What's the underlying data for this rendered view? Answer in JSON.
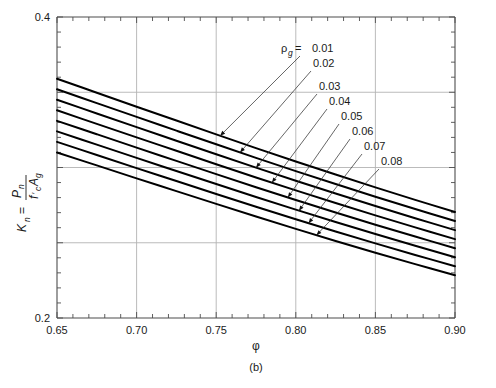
{
  "chart_data": {
    "type": "line",
    "title": "",
    "subtitle": "",
    "xlabel": "φ",
    "ylabel": "K_n = P_n / (f'_c A_g)",
    "ylabel_parts": {
      "lead_symbol": "K",
      "lead_sub": "n",
      "equals": "=",
      "numerator": "P",
      "numerator_sub": "n",
      "denominator_1": "f",
      "denominator_prime": "′",
      "denominator_1_sub": "c",
      "denominator_2": "A",
      "denominator_2_sub": "g"
    },
    "xlim": [
      0.65,
      0.9
    ],
    "ylim": [
      0.2,
      0.4
    ],
    "x_major_ticks": [
      0.65,
      0.7,
      0.75,
      0.8,
      0.85,
      0.9
    ],
    "x_tick_labels": [
      "0.65",
      "0.70",
      "0.75",
      "0.80",
      "0.85",
      "0.90"
    ],
    "x_minor_step": 0.01,
    "y_major_ticks": [
      0.2,
      0.25,
      0.3,
      0.35,
      0.4
    ],
    "y_tick_labels": [
      "0.2",
      "",
      "",
      "",
      "0.4"
    ],
    "y_minor_step": 0.01,
    "grid": true,
    "grid_color": "#b0b0b0",
    "legend_position": "inline-annotations",
    "series_param_symbol": "ρ",
    "series_param_sub": "g",
    "series_param_equals": "=",
    "series": [
      {
        "name": "0.01",
        "label": "0.01",
        "x": [
          0.65,
          0.675,
          0.7,
          0.725,
          0.75,
          0.775,
          0.8,
          0.825,
          0.85,
          0.875,
          0.9
        ],
        "values": [
          0.359,
          0.3497,
          0.3404,
          0.3312,
          0.322,
          0.3129,
          0.304,
          0.2953,
          0.2868,
          0.2785,
          0.2704
        ]
      },
      {
        "name": "0.02",
        "label": "0.02",
        "x": [
          0.65,
          0.675,
          0.7,
          0.725,
          0.75,
          0.775,
          0.8,
          0.825,
          0.85,
          0.875,
          0.9
        ],
        "values": [
          0.352,
          0.3428,
          0.3336,
          0.3245,
          0.3154,
          0.3064,
          0.2976,
          0.289,
          0.2806,
          0.2724,
          0.2644
        ]
      },
      {
        "name": "0.03",
        "label": "0.03",
        "x": [
          0.65,
          0.675,
          0.7,
          0.725,
          0.75,
          0.775,
          0.8,
          0.825,
          0.85,
          0.875,
          0.9
        ],
        "values": [
          0.345,
          0.3359,
          0.3268,
          0.3178,
          0.3088,
          0.2999,
          0.2912,
          0.2827,
          0.2744,
          0.2663,
          0.2584
        ]
      },
      {
        "name": "0.04",
        "label": "0.04",
        "x": [
          0.65,
          0.675,
          0.7,
          0.725,
          0.75,
          0.775,
          0.8,
          0.825,
          0.85,
          0.875,
          0.9
        ],
        "values": [
          0.338,
          0.329,
          0.32,
          0.3111,
          0.3022,
          0.2934,
          0.2848,
          0.2764,
          0.2682,
          0.2602,
          0.2524
        ]
      },
      {
        "name": "0.05",
        "label": "0.05",
        "x": [
          0.65,
          0.675,
          0.7,
          0.725,
          0.75,
          0.775,
          0.8,
          0.825,
          0.85,
          0.875,
          0.9
        ],
        "values": [
          0.331,
          0.3221,
          0.3132,
          0.3044,
          0.2956,
          0.2869,
          0.2784,
          0.2701,
          0.262,
          0.2541,
          0.2464
        ]
      },
      {
        "name": "0.06",
        "label": "0.06",
        "x": [
          0.65,
          0.675,
          0.7,
          0.725,
          0.75,
          0.775,
          0.8,
          0.825,
          0.85,
          0.875,
          0.9
        ],
        "values": [
          0.324,
          0.3152,
          0.3064,
          0.2977,
          0.289,
          0.2804,
          0.272,
          0.2638,
          0.2558,
          0.248,
          0.2404
        ]
      },
      {
        "name": "0.07",
        "label": "0.07",
        "x": [
          0.65,
          0.675,
          0.7,
          0.725,
          0.75,
          0.775,
          0.8,
          0.825,
          0.85,
          0.875,
          0.9
        ],
        "values": [
          0.317,
          0.3083,
          0.2996,
          0.291,
          0.2824,
          0.2739,
          0.2656,
          0.2575,
          0.2496,
          0.2419,
          0.2344
        ]
      },
      {
        "name": "0.08",
        "label": "0.08",
        "x": [
          0.65,
          0.675,
          0.7,
          0.725,
          0.75,
          0.775,
          0.8,
          0.825,
          0.85,
          0.875,
          0.9
        ],
        "values": [
          0.31,
          0.3014,
          0.2928,
          0.2843,
          0.2758,
          0.2674,
          0.2592,
          0.2512,
          0.2434,
          0.2358,
          0.2284
        ]
      }
    ],
    "annotations": [
      {
        "label": "0.01",
        "text_x": 312,
        "text_y": 52,
        "leader_from_x": 300,
        "leader_from_y": 56,
        "target_x": 0.7525,
        "target_y": 0.321
      },
      {
        "label": "0.02",
        "text_x": 313,
        "text_y": 67,
        "leader_from_x": 311,
        "leader_from_y": 71,
        "target_x": 0.765,
        "target_y": 0.311
      },
      {
        "label": "0.03",
        "text_x": 319,
        "text_y": 90,
        "leader_from_x": 317,
        "leader_from_y": 94,
        "target_x": 0.775,
        "target_y": 0.3
      },
      {
        "label": "0.04",
        "text_x": 329,
        "text_y": 105,
        "leader_from_x": 327,
        "leader_from_y": 109,
        "target_x": 0.785,
        "target_y": 0.29
      },
      {
        "label": "0.05",
        "text_x": 341,
        "text_y": 120,
        "leader_from_x": 339,
        "leader_from_y": 124,
        "target_x": 0.795,
        "target_y": 0.28
      },
      {
        "label": "0.06",
        "text_x": 352,
        "text_y": 135,
        "leader_from_x": 350,
        "leader_from_y": 139,
        "target_x": 0.802,
        "target_y": 0.27
      },
      {
        "label": "0.07",
        "text_x": 364,
        "text_y": 150,
        "leader_from_x": 362,
        "leader_from_y": 154,
        "target_x": 0.808,
        "target_y": 0.2605
      },
      {
        "label": "0.08",
        "text_x": 381,
        "text_y": 165,
        "leader_from_x": 379,
        "leader_from_y": 169,
        "target_x": 0.813,
        "target_y": 0.251
      }
    ]
  },
  "figure": {
    "panel_label": "(b)",
    "caption": ""
  },
  "colors": {
    "curve": "#000000",
    "grid": "#b3b3b3",
    "axis": "#4d4d4d",
    "text": "#1a1a1a",
    "background": "#ffffff"
  }
}
